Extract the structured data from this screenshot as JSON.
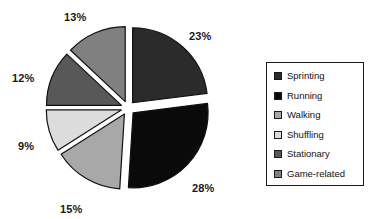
{
  "chart_data": {
    "type": "pie",
    "title": "",
    "subtitle": "",
    "xlabel": "",
    "ylabel": "",
    "legend_position": "right",
    "exploded": true,
    "grid": false,
    "categories": [
      "Sprinting",
      "Running",
      "Walking",
      "Shuffling",
      "Stationary",
      "Game-related"
    ],
    "values": [
      23,
      28,
      15,
      9,
      12,
      13
    ],
    "value_unit": "%",
    "data_labels": [
      "23%",
      "28%",
      "15%",
      "9%",
      "12%",
      "13%"
    ],
    "colors": [
      "#2b2b2b",
      "#0a0a0a",
      "#a8a8a8",
      "#dcdcdc",
      "#585858",
      "#808080"
    ],
    "slices": [
      {
        "label": "Sprinting",
        "value": 23,
        "data_label": "23%",
        "color": "#2b2b2b",
        "start_angle": 0,
        "end_angle": 82.8,
        "label_x": 189,
        "label_y": 30
      },
      {
        "label": "Running",
        "value": 28,
        "data_label": "28%",
        "color": "#0a0a0a",
        "start_angle": 82.8,
        "end_angle": 183.6,
        "label_x": 192,
        "label_y": 182
      },
      {
        "label": "Walking",
        "value": 15,
        "data_label": "15%",
        "color": "#a8a8a8",
        "start_angle": 183.6,
        "end_angle": 237.6,
        "label_x": 60,
        "label_y": 203
      },
      {
        "label": "Shuffling",
        "value": 9,
        "data_label": "9%",
        "color": "#dcdcdc",
        "start_angle": 237.6,
        "end_angle": 270.0,
        "label_x": 18,
        "label_y": 140
      },
      {
        "label": "Stationary",
        "value": 12,
        "data_label": "12%",
        "color": "#585858",
        "start_angle": 270.0,
        "end_angle": 313.2,
        "label_x": 12,
        "label_y": 72
      },
      {
        "label": "Game-related",
        "value": 13,
        "data_label": "13%",
        "color": "#808080",
        "start_angle": 313.2,
        "end_angle": 360.0,
        "label_x": 64,
        "label_y": 11
      }
    ],
    "geometry": {
      "center_x": 128,
      "center_y": 108,
      "radius": 75,
      "explode_offset": 7,
      "outline_color": "#111111",
      "outline_width": 1.2
    }
  },
  "legend": {
    "border_color": "#1a1a1a",
    "items": [
      {
        "label": "Sprinting",
        "color": "#2b2b2b"
      },
      {
        "label": "Running",
        "color": "#0a0a0a"
      },
      {
        "label": "Walking",
        "color": "#a8a8a8"
      },
      {
        "label": "Shuffling",
        "color": "#dcdcdc"
      },
      {
        "label": "Stationary",
        "color": "#585858"
      },
      {
        "label": "Game-related",
        "color": "#808080"
      }
    ]
  }
}
